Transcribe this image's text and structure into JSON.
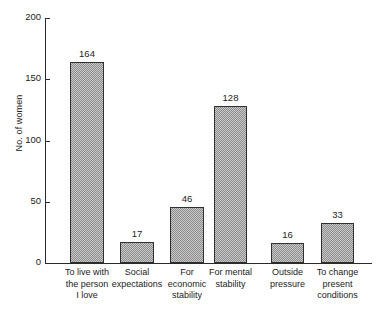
{
  "chart_data": {
    "type": "bar",
    "title": "",
    "xlabel": "",
    "ylabel": "No. of women",
    "ylim": [
      0,
      200
    ],
    "yticks": [
      0,
      50,
      100,
      150,
      200
    ],
    "grid": false,
    "legend": null,
    "categories": [
      "To live with the person I love",
      "Social expectations",
      "For economic stability",
      "For mental stability",
      "Outside pressure",
      "To change present conditions"
    ],
    "category_lines": [
      [
        "To live with",
        "the person",
        "I love"
      ],
      [
        "Social",
        "expectations"
      ],
      [
        "For",
        "economic",
        "stability"
      ],
      [
        "For mental",
        "stability"
      ],
      [
        "Outside",
        "pressure"
      ],
      [
        "To change",
        "present",
        "conditions"
      ]
    ],
    "values": [
      164,
      17,
      46,
      128,
      16,
      33
    ],
    "value_labels": [
      "164",
      "17",
      "46",
      "128",
      "16",
      "33"
    ],
    "ytick_labels": [
      "0",
      "50",
      "100",
      "150",
      "200"
    ]
  },
  "style": {
    "bar_fill": "#c9c9c9",
    "bar_pattern": "#8d8d8d",
    "bar_outline": "#2f2f2f",
    "axis_color": "#2b2b2b",
    "text_color": "#1b1b1b",
    "background": "#ffffff"
  }
}
